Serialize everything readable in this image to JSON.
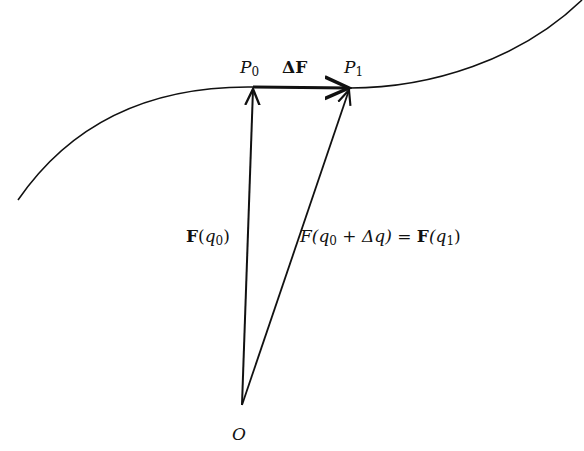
{
  "diagram": {
    "labels": {
      "p0": {
        "main": "P",
        "sub": "0"
      },
      "p1": {
        "main": "P",
        "sub": "1"
      },
      "delta_f": "ΔF",
      "origin": "O",
      "f_q0": {
        "prefix": "F",
        "open": "(",
        "var": "q",
        "sub": "0",
        "close": ")"
      },
      "f_sum": {
        "lhs_func": "F",
        "lhs_open": "(q",
        "lhs_sub": "0",
        "lhs_rest": " + Δq) = ",
        "rhs_func": "F",
        "rhs_open": "(q",
        "rhs_sub": "1",
        "rhs_close": ")"
      }
    },
    "points": {
      "O": [
        242,
        405
      ],
      "P0": [
        253,
        87
      ],
      "P1": [
        350,
        88
      ]
    },
    "colors": {
      "ink": "#111111",
      "background": "#ffffff"
    }
  }
}
